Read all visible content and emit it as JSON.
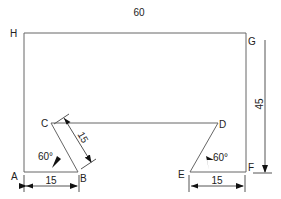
{
  "diagram": {
    "top_dimension": "60",
    "right_dimension": "45",
    "points": {
      "A": "A",
      "B": "B",
      "C": "C",
      "D": "D",
      "E": "E",
      "F": "F",
      "G": "G",
      "H": "H"
    },
    "left_base_dimension": "15",
    "right_base_dimension": "15",
    "slant_dimension": "15",
    "left_angle": "60°",
    "right_angle": "60°",
    "line_color": "#555555"
  }
}
